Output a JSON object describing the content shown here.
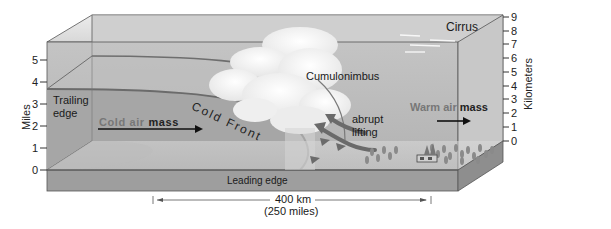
{
  "labels": {
    "cirrus": "Cirrus",
    "cumulonimbus": "Cumulonimbus",
    "trailing_edge_1": "Trailing",
    "trailing_edge_2": "edge",
    "cold_air_word": "Cold air",
    "cold_mass_word": "mass",
    "cold_front": "Cold Front",
    "abrupt": "abrupt",
    "lifting": "lifting",
    "warm_air_word": "Warm air",
    "warm_mass_word": "mass",
    "leading_edge": "Leading edge",
    "distance_km": "400 km",
    "distance_miles": "(250 miles)"
  },
  "left_axis": {
    "title": "Miles",
    "ticks": [
      "5",
      "4",
      "3",
      "2",
      "1",
      "0"
    ]
  },
  "right_axis": {
    "title": "Kilometers",
    "ticks": [
      "9",
      "8",
      "7",
      "6",
      "5",
      "4",
      "3",
      "2",
      "1",
      "0"
    ]
  },
  "colors": {
    "sky_top": "#dcdcdc",
    "sky_front": "#b9b9b9",
    "cold_air": "#a3a3a3",
    "ground": "#9a9a9a",
    "front_line": "#6e6e6e",
    "arrow": "#6a6a6a"
  }
}
